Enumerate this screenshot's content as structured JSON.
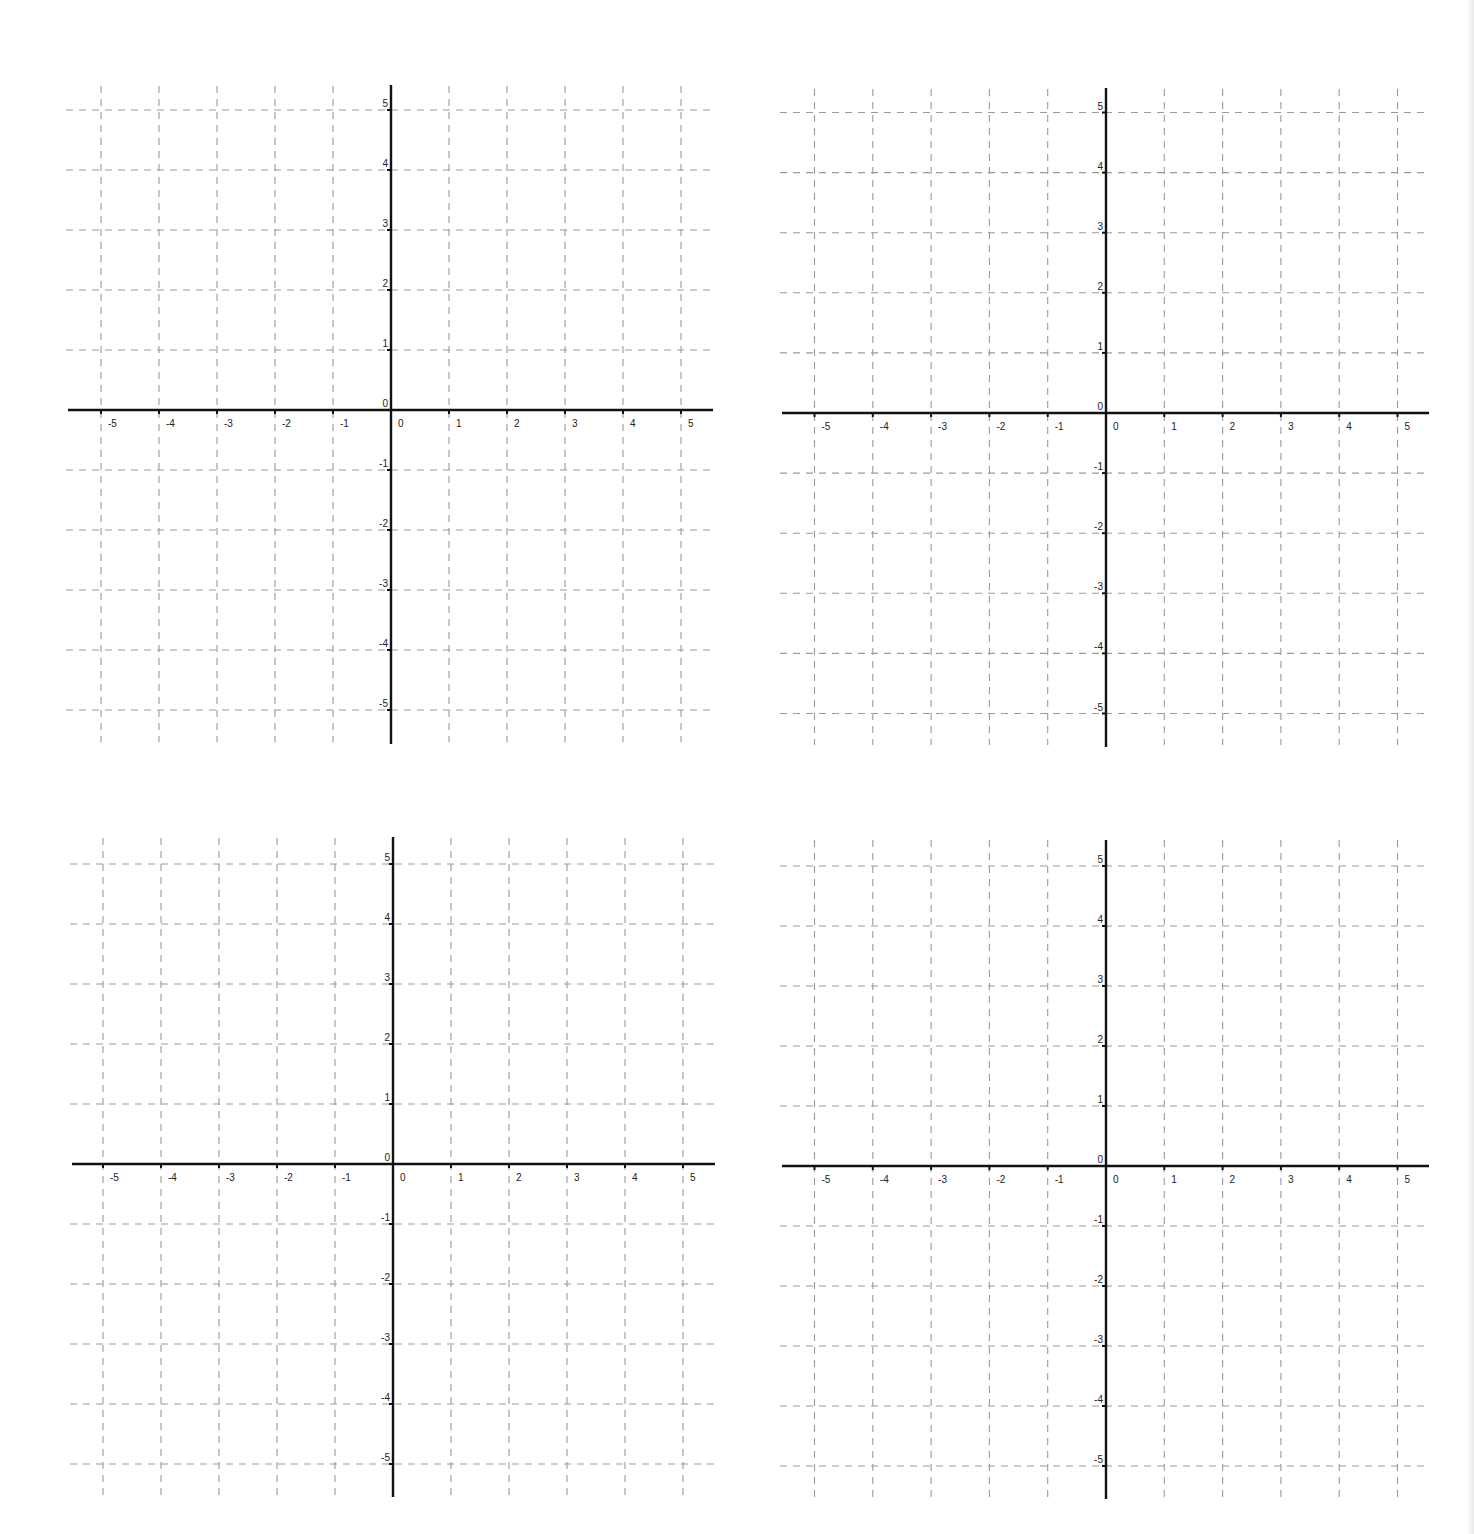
{
  "worksheet": {
    "description": "Four blank coordinate planes",
    "gridline_color": "#9a9a9a",
    "axis_color": "#111111",
    "label_color": "#222222"
  },
  "graphs": [
    {
      "name": "coordinate-plane-top-left",
      "origin": [
        391,
        410
      ],
      "x_unit": 58,
      "y_unit": 60,
      "x_axis_extent": [
        68,
        713
      ],
      "y_axis_extent": [
        85,
        744
      ],
      "grid_x_extent": [
        66,
        713
      ],
      "grid_y_extent": [
        86,
        742
      ]
    },
    {
      "name": "coordinate-plane-top-right",
      "origin": [
        1106,
        413
      ],
      "x_unit": 58.3,
      "y_unit": 60.1,
      "x_axis_extent": [
        782,
        1429
      ],
      "y_axis_extent": [
        88,
        747
      ],
      "grid_x_extent": [
        780,
        1429
      ],
      "grid_y_extent": [
        89,
        745
      ]
    },
    {
      "name": "coordinate-plane-bottom-left",
      "origin": [
        393,
        1164
      ],
      "x_unit": 58,
      "y_unit": 60,
      "x_axis_extent": [
        72,
        715
      ],
      "y_axis_extent": [
        837,
        1497
      ],
      "grid_x_extent": [
        70,
        715
      ],
      "grid_y_extent": [
        838,
        1495
      ]
    },
    {
      "name": "coordinate-plane-bottom-right",
      "origin": [
        1106,
        1166
      ],
      "x_unit": 58.3,
      "y_unit": 60,
      "x_axis_extent": [
        782,
        1429
      ],
      "y_axis_extent": [
        840,
        1499
      ],
      "grid_x_extent": [
        780,
        1429
      ],
      "grid_y_extent": [
        840,
        1497
      ]
    }
  ],
  "axis_labels": {
    "x_ticks": [
      "-5",
      "-4",
      "-3",
      "-2",
      "-1",
      "0",
      "1",
      "2",
      "3",
      "4",
      "5"
    ],
    "y_ticks": [
      "5",
      "4",
      "3",
      "2",
      "1",
      "0",
      "-1",
      "-2",
      "-3",
      "-4",
      "-5"
    ],
    "x_values": [
      -5,
      -4,
      -3,
      -2,
      -1,
      0,
      1,
      2,
      3,
      4,
      5
    ],
    "y_values": [
      5,
      4,
      3,
      2,
      1,
      0,
      -1,
      -2,
      -3,
      -4,
      -5
    ],
    "origin_label": "0"
  },
  "chart_data": [
    {
      "type": "scatter",
      "title": "",
      "xlabel": "",
      "ylabel": "",
      "xlim": [
        -5.5,
        5.5
      ],
      "ylim": [
        -5.5,
        5.5
      ],
      "grid": true,
      "x_tick_labels": [
        "-5",
        "-4",
        "-3",
        "-2",
        "-1",
        "0",
        "1",
        "2",
        "3",
        "4",
        "5"
      ],
      "y_tick_labels": [
        "-5",
        "-4",
        "-3",
        "-2",
        "-1",
        "0",
        "1",
        "2",
        "3",
        "4",
        "5"
      ],
      "series": []
    },
    {
      "type": "scatter",
      "title": "",
      "xlabel": "",
      "ylabel": "",
      "xlim": [
        -5.5,
        5.5
      ],
      "ylim": [
        -5.5,
        5.5
      ],
      "grid": true,
      "x_tick_labels": [
        "-5",
        "-4",
        "-3",
        "-2",
        "-1",
        "0",
        "1",
        "2",
        "3",
        "4",
        "5"
      ],
      "y_tick_labels": [
        "-5",
        "-4",
        "-3",
        "-2",
        "-1",
        "0",
        "1",
        "2",
        "3",
        "4",
        "5"
      ],
      "series": []
    },
    {
      "type": "scatter",
      "title": "",
      "xlabel": "",
      "ylabel": "",
      "xlim": [
        -5.5,
        5.5
      ],
      "ylim": [
        -5.5,
        5.5
      ],
      "grid": true,
      "x_tick_labels": [
        "-5",
        "-4",
        "-3",
        "-2",
        "-1",
        "0",
        "1",
        "2",
        "3",
        "4",
        "5"
      ],
      "y_tick_labels": [
        "-5",
        "-4",
        "-3",
        "-2",
        "-1",
        "0",
        "1",
        "2",
        "3",
        "4",
        "5"
      ],
      "series": []
    },
    {
      "type": "scatter",
      "title": "",
      "xlabel": "",
      "ylabel": "",
      "xlim": [
        -5.5,
        5.5
      ],
      "ylim": [
        -5.5,
        5.5
      ],
      "grid": true,
      "x_tick_labels": [
        "-5",
        "-4",
        "-3",
        "-2",
        "-1",
        "0",
        "1",
        "2",
        "3",
        "4",
        "5"
      ],
      "y_tick_labels": [
        "-5",
        "-4",
        "-3",
        "-2",
        "-1",
        "0",
        "1",
        "2",
        "3",
        "4",
        "5"
      ],
      "series": []
    }
  ]
}
